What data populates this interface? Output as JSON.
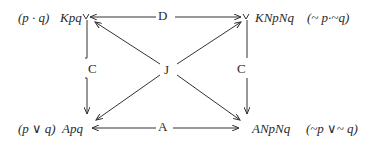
{
  "diagram": {
    "corners": {
      "top_left": {
        "formula": "(p · q)",
        "polish": "Kpq"
      },
      "top_right": {
        "polish": "KNpNq",
        "formula": "(~ p·~q)"
      },
      "bottom_left": {
        "formula": "(p ∨ q)",
        "polish": "Apq"
      },
      "bottom_right": {
        "polish": "ANpNq",
        "formula": "(~p ∨~ q)"
      }
    },
    "edges": {
      "top": "D",
      "bottom": "A",
      "left": "C",
      "right": "C",
      "center": "J"
    },
    "line_color": "#333333"
  }
}
